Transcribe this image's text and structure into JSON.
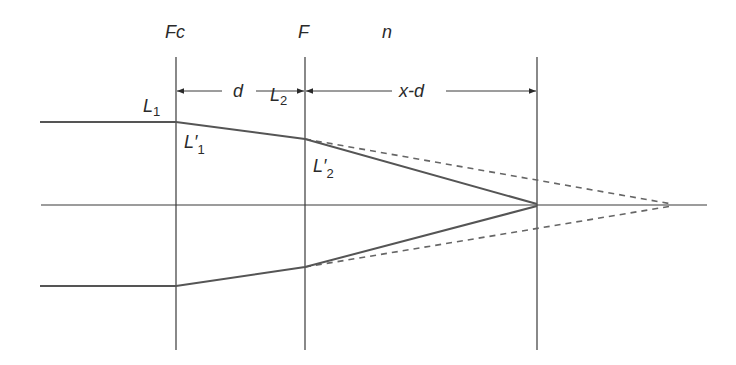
{
  "diagram": {
    "planes": [
      {
        "id": "fc",
        "label": "Fc",
        "x": 176
      },
      {
        "id": "f",
        "label": "F",
        "x": 305
      },
      {
        "id": "n",
        "label": "n",
        "x": 537
      }
    ],
    "dimensions": {
      "d_label": "d",
      "xd_label": "x-d"
    },
    "ray_labels": {
      "l1": {
        "main": "L",
        "sub": "1"
      },
      "l2": {
        "main": "L",
        "sub": "2"
      },
      "l1_prime": {
        "main": "L′",
        "sub": "1"
      },
      "l2_prime": {
        "main": "L′",
        "sub": "2"
      }
    },
    "colors": {
      "line": "#3a3a3a",
      "ray": "#555555",
      "dashed": "#666666",
      "text": "#2a2a2a"
    }
  }
}
